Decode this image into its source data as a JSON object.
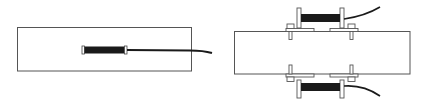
{
  "diagram": {
    "type": "technical-line-drawing",
    "colors": {
      "background": "#ffffff",
      "line": "#555555",
      "gauge_fill": "#1a1a1a",
      "cable": "#1a1a1a"
    },
    "panels": [
      {
        "id": "embedded",
        "description": "Rectangular block with a single embedded gauge and cable exiting right",
        "block": {
          "x": 17,
          "y": 27,
          "w": 174,
          "h": 44
        },
        "gauges": [
          {
            "x": 82,
            "y": 45,
            "w": 45,
            "h": 9
          }
        ]
      },
      {
        "id": "surface-mounted",
        "description": "Rectangular block with two clamped gauges above and below, each with a cable",
        "block": {
          "x": 234,
          "y": 31,
          "w": 176,
          "h": 43
        },
        "gauges": [
          {
            "position": "top",
            "x": 300,
            "y": 13,
            "w": 42,
            "h": 9
          },
          {
            "position": "bottom",
            "x": 300,
            "y": 82,
            "w": 42,
            "h": 9
          }
        ]
      }
    ]
  }
}
